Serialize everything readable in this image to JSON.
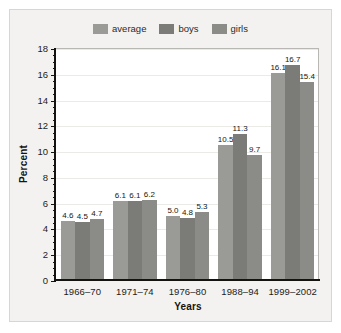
{
  "chart_data": {
    "type": "bar",
    "title": "",
    "xlabel": "Years",
    "ylabel": "Percent",
    "categories": [
      "1966–70",
      "1971–74",
      "1976–80",
      "1988–94",
      "1999–2002"
    ],
    "series": [
      {
        "name": "average",
        "color": "#9a9a96",
        "values": [
          4.6,
          6.1,
          5.0,
          10.5,
          16.1
        ]
      },
      {
        "name": "boys",
        "color": "#7b7b78",
        "values": [
          4.5,
          6.1,
          4.8,
          11.3,
          16.7
        ]
      },
      {
        "name": "girls",
        "color": "#8b8b87",
        "values": [
          4.7,
          6.2,
          5.3,
          9.7,
          15.4
        ]
      }
    ],
    "value_labels": [
      [
        "4.6",
        "4.5",
        "4.7"
      ],
      [
        "6.1",
        "6.1",
        "6.2"
      ],
      [
        "5.0",
        "4.8",
        "5.3"
      ],
      [
        "10.5",
        "11.3",
        "9.7"
      ],
      [
        "16.1",
        "16.7",
        "15.4"
      ]
    ],
    "ylim": [
      0,
      18
    ],
    "ytick_values": [
      0,
      2,
      4,
      6,
      8,
      10,
      12,
      14,
      16,
      18
    ],
    "ytick_labels": [
      "0",
      "2",
      "4",
      "6",
      "8",
      "10",
      "12",
      "14",
      "16",
      "18"
    ],
    "yminor_step": 0.5,
    "grid": "horizontal-major",
    "legend_position": "top-center",
    "plot_background": "#ffffff",
    "figure_background": "#f3f2f0"
  },
  "legend": {
    "entries": [
      {
        "label": "average"
      },
      {
        "label": "boys"
      },
      {
        "label": "girls"
      }
    ]
  }
}
